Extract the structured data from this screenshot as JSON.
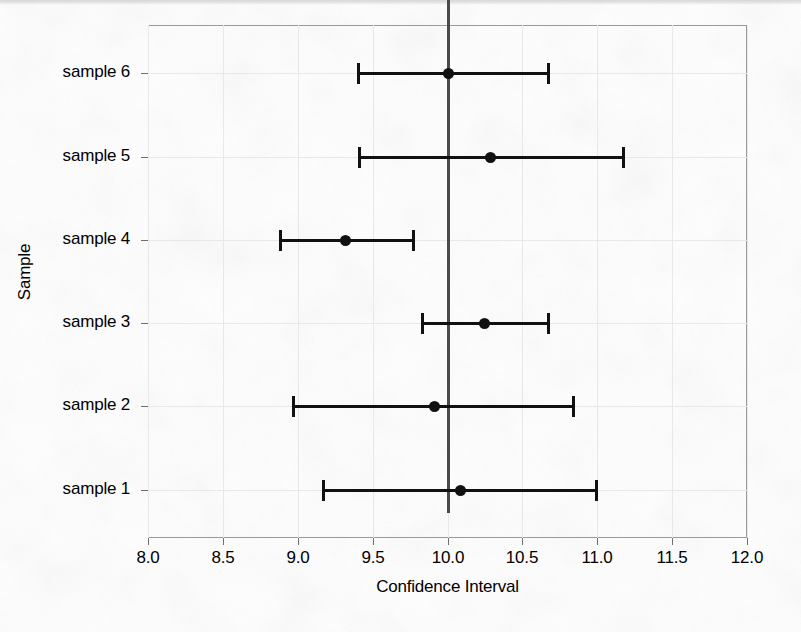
{
  "chart_data": {
    "type": "scatter",
    "title": "",
    "xlabel": "Confidence Interval",
    "ylabel": "Sample",
    "orientation": "horizontal",
    "grid": true,
    "legend": null,
    "xlim": [
      8.0,
      12.0
    ],
    "xticks": [
      8.0,
      8.5,
      9.0,
      9.5,
      10.0,
      10.5,
      11.0,
      11.5,
      12.0
    ],
    "xticklabels": [
      "8.0",
      "8.5",
      "9.0",
      "9.5",
      "10.0",
      "10.5",
      "11.0",
      "11.5",
      "12.0"
    ],
    "categories": [
      "sample 1",
      "sample 2",
      "sample 3",
      "sample 4",
      "sample 5",
      "sample 6"
    ],
    "reference_line": {
      "value": 10.0,
      "orientation": "vertical",
      "color": "#4a4a4a"
    },
    "series": [
      {
        "name": "Confidence Interval",
        "marker": "circle",
        "color": "#111111",
        "points": [
          {
            "category": "sample 6",
            "estimate": 10.01,
            "lower": 9.4,
            "upper": 10.67
          },
          {
            "category": "sample 5",
            "estimate": 10.29,
            "lower": 9.41,
            "upper": 11.17
          },
          {
            "category": "sample 4",
            "estimate": 9.32,
            "lower": 8.88,
            "upper": 9.77
          },
          {
            "category": "sample 3",
            "estimate": 10.25,
            "lower": 9.83,
            "upper": 10.67
          },
          {
            "category": "sample 2",
            "estimate": 9.91,
            "lower": 8.97,
            "upper": 10.84
          },
          {
            "category": "sample 1",
            "estimate": 10.09,
            "lower": 9.17,
            "upper": 10.99
          }
        ]
      }
    ]
  },
  "axes": {
    "x": {
      "label": "Confidence Interval",
      "ticks": [
        {
          "value": 8.0,
          "label": "8.0"
        },
        {
          "value": 8.5,
          "label": "8.5"
        },
        {
          "value": 9.0,
          "label": "9.0"
        },
        {
          "value": 9.5,
          "label": "9.5"
        },
        {
          "value": 10.0,
          "label": "10.0"
        },
        {
          "value": 10.5,
          "label": "10.5"
        },
        {
          "value": 11.0,
          "label": "11.0"
        },
        {
          "value": 11.5,
          "label": "11.5"
        },
        {
          "value": 12.0,
          "label": "12.0"
        }
      ]
    },
    "y": {
      "label": "Sample",
      "ticks": [
        {
          "label": "sample 6"
        },
        {
          "label": "sample 5"
        },
        {
          "label": "sample 4"
        },
        {
          "label": "sample 3"
        },
        {
          "label": "sample 2"
        },
        {
          "label": "sample 1"
        }
      ]
    }
  },
  "colors": {
    "marker": "#111111",
    "errorbar": "#111111",
    "reference_line": "#4a4a4a",
    "grid": "#e8e8e8",
    "panel_border": "#9a9a9a",
    "background": "#ffffff"
  }
}
